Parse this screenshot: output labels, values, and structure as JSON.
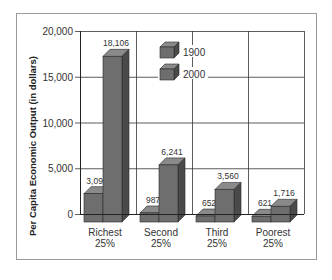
{
  "chart_data": {
    "type": "bar",
    "title": "",
    "xlabel": "",
    "ylabel": "Per Capita Economic Output (in dollars)",
    "ylim": [
      0,
      20000
    ],
    "yticks": [
      "0",
      "5,000",
      "10,000",
      "15,000",
      "20,000"
    ],
    "ytick_values": [
      0,
      5000,
      10000,
      15000,
      20000
    ],
    "categories": [
      "Richest 25%",
      "Second 25%",
      "Third 25%",
      "Poorest 25%"
    ],
    "category_lines": [
      [
        "Richest",
        "25%"
      ],
      [
        "Second",
        "25%"
      ],
      [
        "Third",
        "25%"
      ],
      [
        "Poorest",
        "25%"
      ]
    ],
    "series": [
      {
        "name": "1900",
        "values": [
          3098,
          987,
          652,
          621
        ],
        "labels": [
          "3,098",
          "987",
          "652",
          "621"
        ],
        "color": "#6b6b6b"
      },
      {
        "name": "2000",
        "values": [
          18106,
          6241,
          3560,
          1716
        ],
        "labels": [
          "18,106",
          "6,241",
          "3,560",
          "1,716"
        ],
        "color": "#6b6b6b"
      }
    ],
    "legend": {
      "position": "top-center",
      "entries": [
        "1900",
        "2000"
      ]
    },
    "grid": true,
    "style": "3d-bar"
  }
}
